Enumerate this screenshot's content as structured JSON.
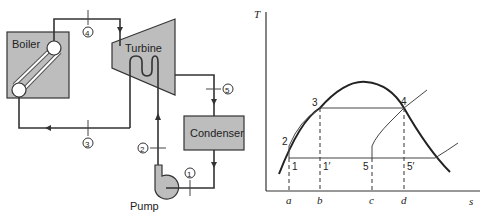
{
  "schematic": {
    "components": {
      "boiler": "Boiler",
      "turbine": "Turbine",
      "condenser": "Condenser",
      "pump": "Pump"
    },
    "state_labels": [
      "1",
      "2",
      "3",
      "4",
      "5"
    ],
    "colors": {
      "component_fill": "#bdbdbd",
      "line": "#333333",
      "background": "#ffffff"
    }
  },
  "ts_diagram": {
    "y_axis_label": "T",
    "x_axis_label": "s",
    "point_labels": {
      "p1": "1",
      "p1p": "1′",
      "p2": "2",
      "p3": "3",
      "p4": "4",
      "p5": "5",
      "p5p": "5′"
    },
    "entropy_ticks": [
      "a",
      "b",
      "c",
      "d"
    ]
  }
}
